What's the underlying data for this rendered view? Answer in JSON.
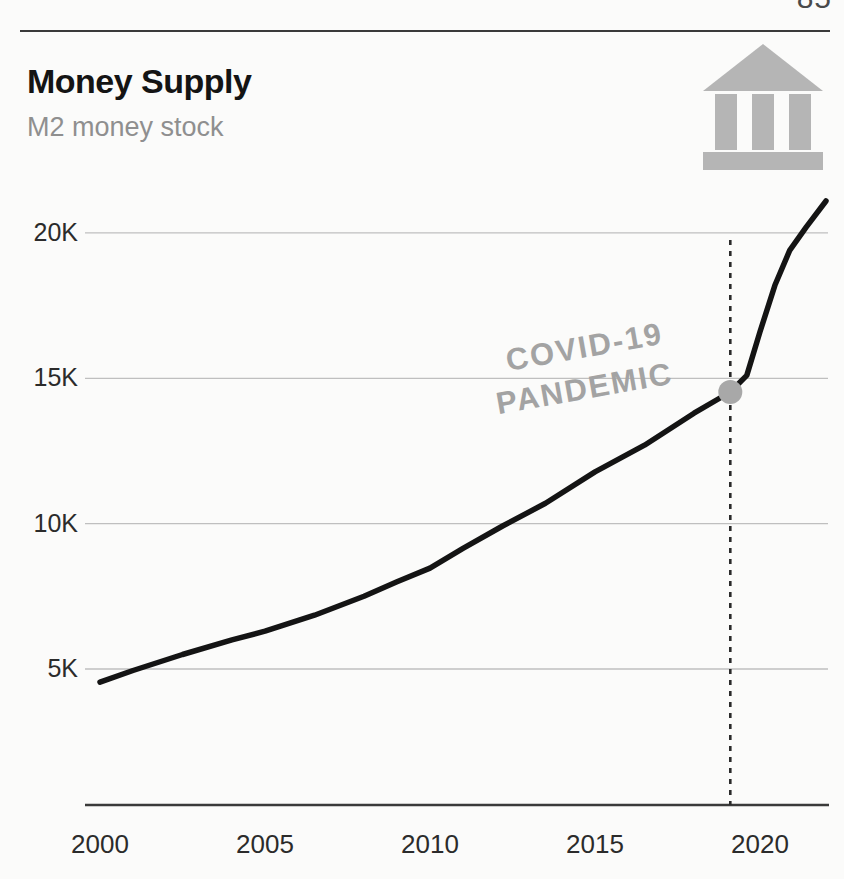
{
  "page": {
    "number": "85"
  },
  "header": {
    "title": "Money Supply",
    "subtitle": "M2 money stock"
  },
  "annotation": {
    "line1": "COVID-19",
    "line2": "PANDEMIC"
  },
  "icons": {
    "bank_icon_color": "#b5b5b5"
  },
  "colors": {
    "line": "#141414",
    "gridline": "#bfbfbf",
    "axis": "#3a3a3a",
    "marker": "#a8a8a8",
    "dashed_line": "#2a2a2a",
    "tick_label": "#2b2b2b"
  },
  "chart_data": {
    "type": "line",
    "title": "Money Supply",
    "subtitle": "M2 money stock",
    "xlabel": "",
    "ylabel": "",
    "y_unit": "K",
    "x_range": [
      2000,
      2022
    ],
    "xticks": [
      2000,
      2005,
      2010,
      2015,
      2020
    ],
    "yticks": [
      {
        "label": "5K",
        "value": 5
      },
      {
        "label": "10K",
        "value": 10
      },
      {
        "label": "15K",
        "value": 15
      },
      {
        "label": "20K",
        "value": 20
      }
    ],
    "grid": "horizontal-only",
    "legend": "none",
    "series": [
      {
        "name": "M2 money stock",
        "x": [
          2000,
          2001,
          2002.5,
          2004,
          2005,
          2006.5,
          2008,
          2009,
          2010,
          2011,
          2012.2,
          2013.5,
          2015,
          2016.5,
          2018,
          2019.1,
          2019.6,
          2020.0,
          2020.45,
          2020.9,
          2021.4,
          2022.0
        ],
        "y": [
          4.55,
          4.95,
          5.5,
          6.0,
          6.3,
          6.85,
          7.5,
          8.0,
          8.47,
          9.15,
          9.92,
          10.7,
          11.78,
          12.7,
          13.8,
          14.53,
          15.1,
          16.6,
          18.2,
          19.4,
          20.2,
          21.1
        ]
      }
    ],
    "marker": {
      "x": 2019.1,
      "y": 14.53,
      "label": "COVID-19 PANDEMIC"
    },
    "vline": {
      "x": 2019.1,
      "style": "dashed",
      "from_y_px": 240,
      "to_y_px": 805
    }
  }
}
